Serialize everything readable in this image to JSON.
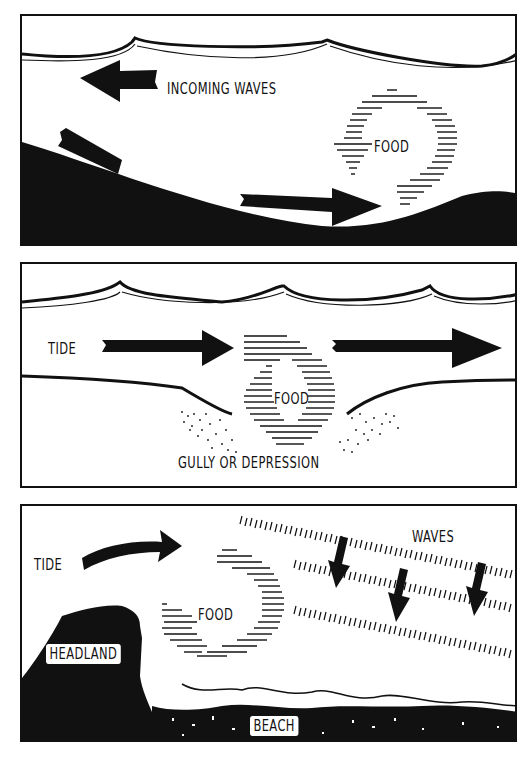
{
  "colors": {
    "ink": "#111111",
    "paper": "#ffffff"
  },
  "panels": [
    {
      "id": "undertow",
      "labels": {
        "incoming_waves": "INCOMING WAVES",
        "food": "FOOD",
        "undertow": "UNDERTOW"
      },
      "icons": [
        "wave-surface",
        "arrow-left",
        "arrow-right",
        "circular-food-arrow",
        "sloping-seabed"
      ]
    },
    {
      "id": "gully",
      "labels": {
        "tide": "TIDE",
        "food": "FOOD",
        "gully": "GULLY OR DEPRESSION"
      },
      "icons": [
        "wave-surface",
        "arrow-right",
        "arrow-right",
        "circular-food-eddy",
        "stippled-sand"
      ]
    },
    {
      "id": "headland",
      "labels": {
        "tide": "TIDE",
        "waves": "WAVES",
        "food": "FOOD",
        "headland": "HEADLAND",
        "beach": "BEACH"
      },
      "icons": [
        "curved-arrow-right",
        "wave-lines",
        "arrow-down",
        "circular-food-eddy",
        "headland-rock",
        "beach"
      ]
    }
  ]
}
